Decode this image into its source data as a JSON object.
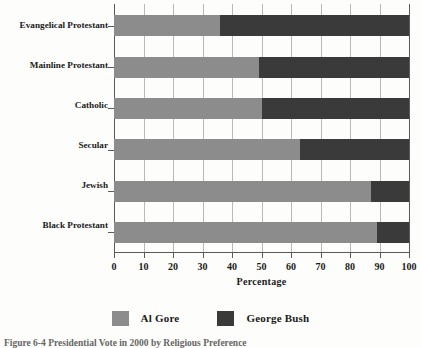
{
  "chart_data": {
    "type": "bar",
    "orientation": "horizontal",
    "stacked": true,
    "title": "",
    "xlabel": "Percentage",
    "ylabel": "",
    "xlim": [
      0,
      100
    ],
    "xticks": [
      0,
      10,
      20,
      30,
      40,
      50,
      60,
      70,
      80,
      90,
      100
    ],
    "xtick_labels": [
      "0",
      "10",
      "20",
      "30",
      "40",
      "50",
      "60",
      "70",
      "80",
      "90",
      "100"
    ],
    "grid": true,
    "grid_axis": "x",
    "legend_position": "bottom",
    "categories": [
      "Evangelical Protestant",
      "Mainline Protestant",
      "Catholic",
      "Secular",
      "Jewish",
      "Black Protestant"
    ],
    "series": [
      {
        "name": "Al Gore",
        "color": "#8c8c8c",
        "values": [
          36,
          49,
          50,
          63,
          87,
          89
        ]
      },
      {
        "name": "George Bush",
        "color": "#3a3a3a",
        "values": [
          64,
          51,
          50,
          37,
          13,
          11
        ]
      }
    ]
  },
  "axis": {
    "x_title": "Percentage",
    "tick_labels": [
      "0",
      "10",
      "20",
      "30",
      "40",
      "50",
      "60",
      "70",
      "80",
      "90",
      "100"
    ],
    "category_labels": [
      "Evangelical Protestant",
      "Mainline Protestant",
      "Catholic",
      "Secular",
      "Jewish",
      "Black Protestant"
    ]
  },
  "legend": {
    "items": [
      {
        "label": "Al Gore",
        "color": "#8c8c8c"
      },
      {
        "label": "George Bush",
        "color": "#3a3a3a"
      }
    ]
  },
  "caption": {
    "number": "Figure 6-4",
    "text": "Presidential Vote in 2000 by Religious Preference",
    "full": "Figure 6-4  Presidential Vote in 2000 by Religious Preference"
  },
  "colors": {
    "series_a": "#8c8c8c",
    "series_b": "#3a3a3a",
    "axis": "#5a5a5a",
    "grid": "#b9b9b9",
    "page": "#fdfdfb"
  }
}
